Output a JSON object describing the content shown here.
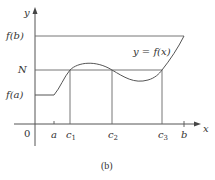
{
  "figure": {
    "caption": "(b)",
    "axes": {
      "x_label": "x",
      "y_label": "y",
      "origin_label": "0"
    },
    "y_levels": {
      "fb": "f(b)",
      "n": "N",
      "fa": "f(a)"
    },
    "x_ticks": {
      "a": "a",
      "c1": "c",
      "c1_sub": "1",
      "c2": "c",
      "c2_sub": "2",
      "c3": "c",
      "c3_sub": "3",
      "b": "b"
    },
    "curve_label": "y = f(x)",
    "colors": {
      "stroke": "#555555",
      "text": "#333333"
    }
  }
}
